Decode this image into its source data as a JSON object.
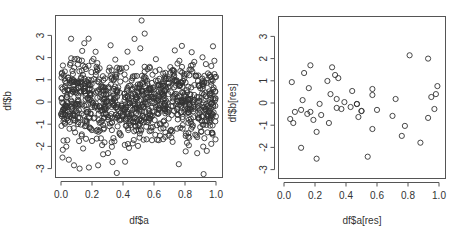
{
  "chart_data": [
    {
      "type": "scatter",
      "title": "",
      "xlabel": "df$a",
      "ylabel": "df$b",
      "xlim": [
        -0.04,
        1.04
      ],
      "ylim": [
        -3.5,
        3.9
      ],
      "x_ticks": [
        "0.0",
        "0.2",
        "0.4",
        "0.6",
        "0.8",
        "1.0"
      ],
      "y_ticks": [
        "-3",
        "-2",
        "-1",
        "0",
        "1",
        "2",
        "3"
      ],
      "grid": false,
      "legend": null,
      "marker": "open-circle",
      "n_points_approx": 1000,
      "distribution": "x ~ Uniform(0,1), y ~ Normal(0,1)",
      "notable_points": [
        {
          "x": 0.52,
          "y": 3.67
        },
        {
          "x": 0.54,
          "y": 3.08
        },
        {
          "x": 0.15,
          "y": 2.65
        },
        {
          "x": 0.92,
          "y": -3.25
        },
        {
          "x": 0.36,
          "y": -3.2
        },
        {
          "x": 0.12,
          "y": -3.0
        },
        {
          "x": 0.18,
          "y": -2.95
        },
        {
          "x": 0.01,
          "y": -2.5
        },
        {
          "x": 0.05,
          "y": -2.6
        },
        {
          "x": 0.76,
          "y": -2.8
        }
      ]
    },
    {
      "type": "scatter",
      "title": "",
      "xlabel": "df$a[res]",
      "ylabel": "df$b[res]",
      "xlim": [
        -0.04,
        1.04
      ],
      "ylim": [
        -3.5,
        3.9
      ],
      "x_ticks": [
        "0.0",
        "0.2",
        "0.4",
        "0.6",
        "0.8",
        "1.0"
      ],
      "y_ticks": [
        "-3",
        "-2",
        "-1",
        "0",
        "1",
        "2",
        "3"
      ],
      "grid": false,
      "legend": null,
      "marker": "open-circle",
      "points": [
        {
          "x": 0.17,
          "y": 1.7
        },
        {
          "x": 0.31,
          "y": 1.61
        },
        {
          "x": 0.13,
          "y": 1.35
        },
        {
          "x": 0.33,
          "y": 1.26
        },
        {
          "x": 0.35,
          "y": 1.12
        },
        {
          "x": 0.05,
          "y": 0.94
        },
        {
          "x": 0.28,
          "y": 0.99
        },
        {
          "x": 0.16,
          "y": 0.67
        },
        {
          "x": 0.44,
          "y": 0.54
        },
        {
          "x": 0.3,
          "y": 0.4
        },
        {
          "x": 0.12,
          "y": 0.13
        },
        {
          "x": 0.34,
          "y": 0.18
        },
        {
          "x": 0.23,
          "y": -0.04
        },
        {
          "x": 0.39,
          "y": 0.04
        },
        {
          "x": 0.47,
          "y": -0.04
        },
        {
          "x": 0.34,
          "y": -0.22
        },
        {
          "x": 0.43,
          "y": -0.18
        },
        {
          "x": 0.37,
          "y": -0.27
        },
        {
          "x": 0.11,
          "y": -0.31
        },
        {
          "x": 0.07,
          "y": -0.4
        },
        {
          "x": 0.17,
          "y": -0.4
        },
        {
          "x": 0.15,
          "y": -0.49
        },
        {
          "x": 0.24,
          "y": -0.54
        },
        {
          "x": 0.5,
          "y": -0.36
        },
        {
          "x": 0.04,
          "y": -0.72
        },
        {
          "x": 0.19,
          "y": -0.76
        },
        {
          "x": 0.48,
          "y": -0.63
        },
        {
          "x": 0.06,
          "y": -0.9
        },
        {
          "x": 0.29,
          "y": -0.9
        },
        {
          "x": 0.21,
          "y": -1.3
        },
        {
          "x": 0.11,
          "y": -2.02
        },
        {
          "x": 0.21,
          "y": -2.51
        },
        {
          "x": 0.54,
          "y": -2.42
        },
        {
          "x": 0.81,
          "y": 2.15
        },
        {
          "x": 0.93,
          "y": 2.0
        },
        {
          "x": 0.99,
          "y": 0.76
        },
        {
          "x": 0.57,
          "y": 0.63
        },
        {
          "x": 0.98,
          "y": 0.4
        },
        {
          "x": 0.57,
          "y": 0.36
        },
        {
          "x": 0.95,
          "y": 0.27
        },
        {
          "x": 0.72,
          "y": 0.18
        },
        {
          "x": 0.47,
          "y": -0.05
        },
        {
          "x": 0.5,
          "y": -0.36
        },
        {
          "x": 0.6,
          "y": -0.31
        },
        {
          "x": 0.97,
          "y": -0.27
        },
        {
          "x": 0.57,
          "y": -1.17
        },
        {
          "x": 0.7,
          "y": -0.58
        },
        {
          "x": 0.93,
          "y": -0.67
        },
        {
          "x": 0.78,
          "y": -1.03
        },
        {
          "x": 0.76,
          "y": -1.48
        },
        {
          "x": 0.88,
          "y": -1.79
        }
      ]
    }
  ]
}
